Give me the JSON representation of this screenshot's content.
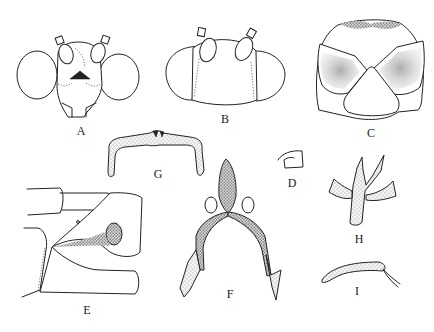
{
  "figure": {
    "type": "scientific-morphology-plate",
    "panels": [
      {
        "id": "A",
        "label": "A",
        "description": "head, frontal view with large compound eyes and antennal bases"
      },
      {
        "id": "B",
        "label": "B",
        "description": "head, dorsal view"
      },
      {
        "id": "C",
        "label": "C",
        "description": "thorax/pronotum plates with stippled shading"
      },
      {
        "id": "D",
        "label": "D",
        "description": "small hooked structure"
      },
      {
        "id": "E",
        "label": "E",
        "description": "abdominal terminalia, lateral view with stippled spermatheca"
      },
      {
        "id": "F",
        "label": "F",
        "description": "genitalia (aedeagus/parameres), ventral view"
      },
      {
        "id": "G",
        "label": "G",
        "description": "arched stippled sclerite"
      },
      {
        "id": "H",
        "label": "H",
        "description": "branched stippled sclerite"
      },
      {
        "id": "I",
        "label": "I",
        "description": "curved stippled process"
      }
    ],
    "colors": {
      "ink": "#222222",
      "background": "#ffffff"
    }
  }
}
